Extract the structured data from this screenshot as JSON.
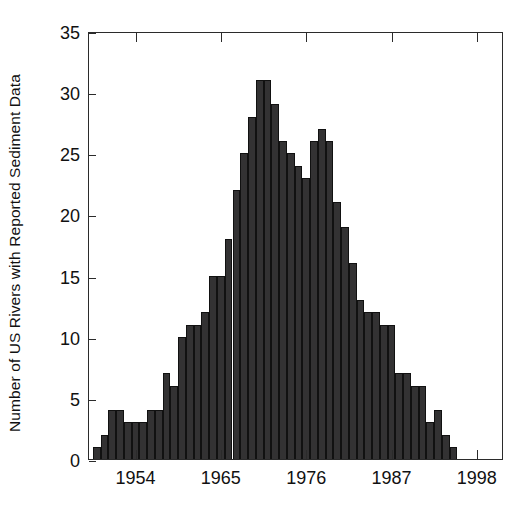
{
  "chart_data": {
    "type": "bar",
    "title": "",
    "subtitle": "",
    "xlabel": "",
    "ylabel": "Number of US Rivers with Reported Sediment Data",
    "xlim": [
      1948,
      2001.5
    ],
    "ylim": [
      0,
      35
    ],
    "ytick_values": [
      0,
      5,
      10,
      15,
      20,
      25,
      30,
      35
    ],
    "ytick_labels": [
      "0",
      "5",
      "10",
      "15",
      "20",
      "25",
      "30",
      "35"
    ],
    "xtick_values": [
      1954,
      1965,
      1976,
      1987,
      1998
    ],
    "xtick_labels": [
      "1954",
      "1965",
      "1976",
      "1987",
      "1998"
    ],
    "grid": false,
    "legend": null,
    "bar_color": "#333233",
    "bar_edge_color": "#111111",
    "axis_color": "#2b2b2b",
    "background": "#ffffff",
    "categories": [
      1949,
      1950,
      1951,
      1952,
      1953,
      1954,
      1955,
      1956,
      1957,
      1958,
      1959,
      1960,
      1961,
      1962,
      1963,
      1964,
      1965,
      1966,
      1967,
      1968,
      1969,
      1970,
      1971,
      1972,
      1973,
      1974,
      1975,
      1976,
      1977,
      1978,
      1979,
      1980,
      1981,
      1982,
      1983,
      1984,
      1985,
      1986,
      1987,
      1988,
      1989,
      1990,
      1991,
      1992,
      1993,
      1994,
      1995
    ],
    "values": [
      1,
      2,
      4,
      4,
      3,
      3,
      3,
      4,
      4,
      7,
      6,
      10,
      11,
      11,
      12,
      15,
      15,
      18,
      22,
      25,
      28,
      31,
      31,
      29,
      26,
      25,
      24,
      23,
      26,
      27,
      26,
      21,
      19,
      16,
      13,
      12,
      12,
      11,
      11,
      7,
      7,
      6,
      6,
      3,
      4,
      2,
      1
    ]
  }
}
